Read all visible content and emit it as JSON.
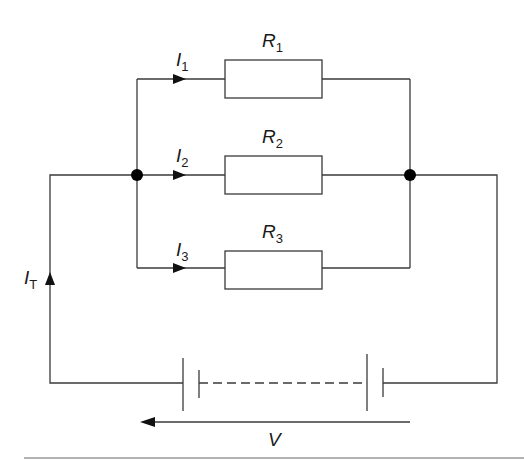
{
  "diagram": {
    "type": "parallel resistor circuit",
    "resistors": [
      {
        "label": "R",
        "subscript": "1"
      },
      {
        "label": "R",
        "subscript": "2"
      },
      {
        "label": "R",
        "subscript": "3"
      }
    ],
    "branch_currents": [
      {
        "label": "I",
        "subscript": "1"
      },
      {
        "label": "I",
        "subscript": "2"
      },
      {
        "label": "I",
        "subscript": "3"
      }
    ],
    "total_current": {
      "label": "I",
      "subscript": "T"
    },
    "voltage": {
      "label": "V"
    },
    "colors": {
      "line": "#3a3a3a",
      "node": "#000000",
      "background": "#ffffff"
    }
  }
}
